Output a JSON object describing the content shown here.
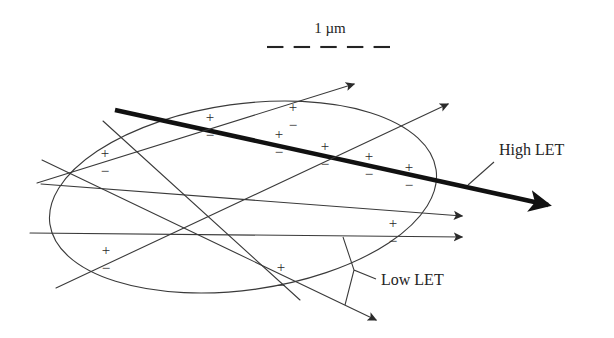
{
  "figure": {
    "name": "let-track-structure-diagram",
    "background_color": "#ffffff",
    "line_color": "#3a3a3a",
    "bold_line_color": "#111111",
    "text_color": "#242424"
  },
  "scale_bar": {
    "label": "1 µm",
    "label_x": 330,
    "label_y": 33,
    "dash_y": 47,
    "dash_x_start": 267,
    "dash_x_end": 390,
    "dash_count": 5
  },
  "annotations": [
    {
      "id": "high-let",
      "label": "High LET",
      "x": 499,
      "y": 155,
      "leader": "M 494 162 L 468 185"
    },
    {
      "id": "low-let",
      "label": "Low LET",
      "x": 381,
      "y": 285,
      "leader": "M 376 279 L 354 270 L 343 237 M 354 270 L 345 305"
    }
  ],
  "nucleus": {
    "name": "cell-nucleus-ellipse",
    "cx": 243,
    "cy": 197,
    "rx": 195,
    "ry": 93,
    "rotation": -8
  },
  "tracks": [
    {
      "id": "high-let-track",
      "type": "high-LET",
      "stroke_width": 4.6,
      "color": "#111111",
      "x1": 115,
      "y1": 110,
      "x2": 548,
      "y2": 205,
      "arrowhead": true
    },
    {
      "id": "low-let-track-1",
      "type": "low-LET",
      "stroke_width": 1.1,
      "color": "#3a3a3a",
      "x1": 37,
      "y1": 183,
      "x2": 354,
      "y2": 84,
      "arrowhead": true
    },
    {
      "id": "low-let-track-2",
      "type": "low-LET",
      "stroke_width": 1.1,
      "color": "#3a3a3a",
      "x1": 56,
      "y1": 288,
      "x2": 448,
      "y2": 104,
      "arrowhead": true
    },
    {
      "id": "low-let-track-3",
      "type": "low-LET",
      "stroke_width": 1.1,
      "color": "#3a3a3a",
      "x1": 41,
      "y1": 184,
      "x2": 462,
      "y2": 216,
      "arrowhead": true
    },
    {
      "id": "low-let-track-4",
      "type": "low-LET",
      "stroke_width": 1.1,
      "color": "#3a3a3a",
      "x1": 30,
      "y1": 233,
      "x2": 462,
      "y2": 237,
      "arrowhead": true
    },
    {
      "id": "low-let-track-5",
      "type": "low-LET",
      "stroke_width": 1.1,
      "color": "#3a3a3a",
      "x1": 42,
      "y1": 160,
      "x2": 376,
      "y2": 320,
      "arrowhead": true
    },
    {
      "id": "low-let-track-6",
      "type": "low-LET",
      "stroke_width": 1.1,
      "color": "#3a3a3a",
      "x1": 103,
      "y1": 121,
      "x2": 300,
      "y2": 300,
      "arrowhead": false
    }
  ],
  "ion_pairs": [
    {
      "id": "ion-pair-1",
      "plus": "+",
      "minus": "−",
      "x": 210,
      "y": 122
    },
    {
      "id": "ion-pair-2",
      "plus": "+",
      "minus": "−",
      "x": 293,
      "y": 112
    },
    {
      "id": "ion-pair-3",
      "plus": "+",
      "minus": "−",
      "x": 279,
      "y": 139
    },
    {
      "id": "ion-pair-4",
      "plus": "+",
      "minus": "−",
      "x": 325,
      "y": 151
    },
    {
      "id": "ion-pair-5",
      "plus": "+",
      "minus": "−",
      "x": 369,
      "y": 161
    },
    {
      "id": "ion-pair-6",
      "plus": "+",
      "minus": "−",
      "x": 409,
      "y": 172
    },
    {
      "id": "ion-pair-7",
      "plus": "+",
      "minus": "−",
      "x": 105,
      "y": 158
    },
    {
      "id": "ion-pair-8",
      "plus": "+",
      "minus": "−",
      "x": 106,
      "y": 255
    },
    {
      "id": "ion-pair-9",
      "plus": "+",
      "minus": "−",
      "x": 281,
      "y": 272
    },
    {
      "id": "ion-pair-10",
      "plus": "+",
      "minus": "−",
      "x": 393,
      "y": 228
    }
  ],
  "ion_pair_legend": {
    "plus_symbol": "+",
    "minus_symbol": "−",
    "count": 10
  }
}
